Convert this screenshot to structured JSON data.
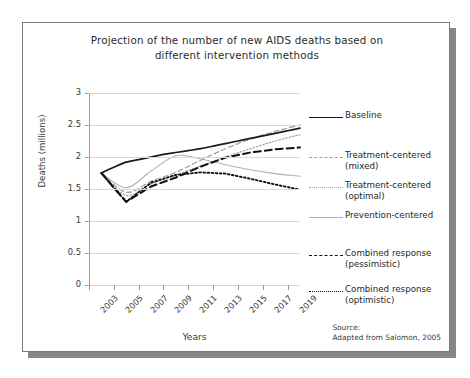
{
  "figure": {
    "title_line1": "Projection of the number of new AIDS deaths based on",
    "title_line2": "different intervention methods",
    "source_line1": "Source:",
    "source_line2": "Adapted from Salomon, 2005"
  },
  "axes": {
    "ylabel": "Deaths (millions)",
    "xlabel": "Years",
    "yticks": [
      "3",
      "2.5",
      "2",
      "1.5",
      "1",
      "0.5",
      "0"
    ],
    "xticks": [
      "2003",
      "2005",
      "2007",
      "2009",
      "2011",
      "2013",
      "2015",
      "2017",
      "2019"
    ]
  },
  "legend": [
    {
      "label_line1": "Baseline",
      "label_line2": "",
      "style": "s-solid-dark"
    },
    {
      "label_line1": "Treatment-centered",
      "label_line2": "(mixed)",
      "style": "s-dash-gray"
    },
    {
      "label_line1": "Treatment-centered",
      "label_line2": "(optimal)",
      "style": "s-dot-gray"
    },
    {
      "label_line1": "Prevention-centered",
      "label_line2": "",
      "style": "s-solid-gray"
    },
    {
      "label_line1": "Combined response",
      "label_line2": "(pessimistic)",
      "style": "s-dash-dark"
    },
    {
      "label_line1": "Combined response",
      "label_line2": "(optimistic)",
      "style": "s-dot-dark"
    }
  ],
  "colors": {
    "baseline": "#1a1a1a",
    "treatment_mixed": "#9d9d9d",
    "treatment_optimal": "#a7a7a7",
    "prevention": "#b0b0b0",
    "combined_pessimistic": "#111111",
    "combined_optimistic": "#111111",
    "grid": "#d9d9d9",
    "axis": "#9a9a9a",
    "frame": "#7a7a7a",
    "shadow": "#868686"
  },
  "chart_data": {
    "type": "line",
    "title": "Projection of the number of new AIDS deaths based on different intervention methods",
    "xlabel": "Years",
    "ylabel": "Deaths (millions)",
    "xlim": [
      2003,
      2020
    ],
    "ylim": [
      0,
      3
    ],
    "yticks": [
      0,
      0.5,
      1,
      1.5,
      2,
      2.5,
      3
    ],
    "xticks": [
      2003,
      2005,
      2007,
      2009,
      2011,
      2013,
      2015,
      2017,
      2019
    ],
    "grid": "horizontal",
    "legend_position": "right",
    "annotation": "Source: Adapted from Salomon, 2005",
    "series": [
      {
        "name": "Baseline",
        "style": "solid",
        "color": "#1a1a1a",
        "x": [
          2004,
          2005,
          2006,
          2007,
          2008,
          2009,
          2010,
          2011,
          2012,
          2013,
          2014,
          2015,
          2016,
          2017,
          2018,
          2019,
          2020
        ],
        "values": [
          1.75,
          1.84,
          1.92,
          1.96,
          2.0,
          2.04,
          2.07,
          2.1,
          2.13,
          2.17,
          2.21,
          2.25,
          2.29,
          2.33,
          2.37,
          2.41,
          2.45
        ]
      },
      {
        "name": "Treatment-centered (mixed)",
        "style": "dashed",
        "color": "#9d9d9d",
        "x": [
          2004,
          2006,
          2008,
          2010,
          2012,
          2014,
          2016,
          2018,
          2020
        ],
        "values": [
          1.75,
          1.45,
          1.62,
          1.76,
          1.95,
          2.13,
          2.28,
          2.4,
          2.5
        ]
      },
      {
        "name": "Treatment-centered (optimal)",
        "style": "dotted",
        "color": "#a7a7a7",
        "x": [
          2004,
          2006,
          2008,
          2010,
          2012,
          2014,
          2016,
          2018,
          2020
        ],
        "values": [
          1.75,
          1.4,
          1.58,
          1.72,
          1.86,
          2.0,
          2.13,
          2.25,
          2.35
        ]
      },
      {
        "name": "Prevention-centered",
        "style": "solid",
        "color": "#b0b0b0",
        "x": [
          2004,
          2006,
          2008,
          2010,
          2012,
          2014,
          2016,
          2018,
          2020
        ],
        "values": [
          1.75,
          1.52,
          1.78,
          2.02,
          1.97,
          1.88,
          1.8,
          1.74,
          1.7
        ]
      },
      {
        "name": "Combined response (pessimistic)",
        "style": "dashed",
        "color": "#111111",
        "x": [
          2004,
          2005,
          2006,
          2007,
          2008,
          2010,
          2012,
          2014,
          2016,
          2018,
          2020
        ],
        "values": [
          1.75,
          1.52,
          1.3,
          1.42,
          1.54,
          1.68,
          1.85,
          1.99,
          2.07,
          2.12,
          2.15
        ]
      },
      {
        "name": "Combined response (optimistic)",
        "style": "dotted",
        "color": "#111111",
        "x": [
          2004,
          2005,
          2006,
          2007,
          2008,
          2010,
          2012,
          2014,
          2016,
          2018,
          2020
        ],
        "values": [
          1.75,
          1.52,
          1.3,
          1.45,
          1.6,
          1.72,
          1.76,
          1.74,
          1.66,
          1.57,
          1.49
        ]
      }
    ]
  }
}
